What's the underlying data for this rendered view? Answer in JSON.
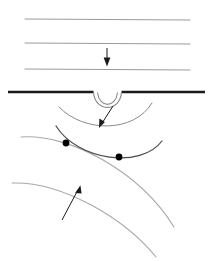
{
  "figure": {
    "width": 213,
    "height": 261,
    "background_color": "#ffffff"
  },
  "colors": {
    "thin_line": "#9a9a9a",
    "interface_line": "#1a1a1a",
    "gray_curve": "#a8a8a8",
    "dark_curve": "#4a4a4a",
    "arrow": "#1a1a1a",
    "dot_fill": "#000000"
  },
  "chart_data": {
    "type": "line",
    "xlabel": "",
    "ylabel": "",
    "xlim": [
      0,
      213
    ],
    "ylim": [
      0,
      261
    ],
    "grid": false,
    "legend": "none",
    "series": [
      {
        "name": "incident-wavefront-1",
        "kind": "straight-line",
        "stroke": "#9a9a9a",
        "stroke_width": 1.1,
        "points": [
          [
            25,
            19
          ],
          [
            190,
            20
          ]
        ]
      },
      {
        "name": "incident-wavefront-2",
        "kind": "straight-line",
        "stroke": "#9a9a9a",
        "stroke_width": 1.1,
        "points": [
          [
            25,
            43
          ],
          [
            190,
            44
          ]
        ]
      },
      {
        "name": "incident-wavefront-3",
        "kind": "straight-line",
        "stroke": "#9a9a9a",
        "stroke_width": 1.1,
        "points": [
          [
            25,
            69
          ],
          [
            190,
            70
          ]
        ]
      },
      {
        "name": "interface-line-left",
        "kind": "straight-line",
        "stroke": "#1a1a1a",
        "stroke_width": 2.3,
        "points": [
          [
            8,
            92
          ],
          [
            93,
            92
          ]
        ]
      },
      {
        "name": "interface-line-right",
        "kind": "straight-line",
        "stroke": "#1a1a1a",
        "stroke_width": 2.3,
        "points": [
          [
            122,
            92
          ],
          [
            205,
            92
          ]
        ]
      },
      {
        "name": "aperture-notch-outer",
        "kind": "arc-open-up",
        "stroke": "#8a8a8a",
        "stroke_width": 1.1,
        "path": "M 93 92 C 94 112, 121 112, 122 92"
      },
      {
        "name": "aperture-notch-inner",
        "kind": "arc-open-up",
        "stroke": "#8a8a8a",
        "stroke_width": 1.1,
        "path": "M 97 93 C 99 108, 117 108, 119 93"
      },
      {
        "name": "diffracted-arc",
        "kind": "arc-open-up",
        "stroke": "#8a8a8a",
        "stroke_width": 1.0,
        "path": "M 60 108 C 85 132, 135 132, 152 104"
      },
      {
        "name": "refracted-dark-curve",
        "kind": "arc-open-up",
        "stroke": "#4a4a4a",
        "stroke_width": 1.2,
        "path": "M 57 126 C 78 160, 140 168, 161 142"
      },
      {
        "name": "gray-arc-upper",
        "kind": "arc-open-down",
        "stroke": "#a8a8a8",
        "stroke_width": 1.1,
        "path": "M 21 137 C 70 134, 140 172, 174 227"
      },
      {
        "name": "gray-arc-lower",
        "kind": "arc-open-down",
        "stroke": "#a8a8a8",
        "stroke_width": 1.1,
        "path": "M 12 183 C 62 182, 124 218, 156 257"
      }
    ],
    "markers": [
      {
        "name": "intersection-point-left",
        "x": 66,
        "y": 143,
        "radius": 3.4,
        "fill": "#000000"
      },
      {
        "name": "intersection-point-right",
        "x": 119,
        "y": 157,
        "radius": 3.4,
        "fill": "#000000"
      }
    ],
    "annotations": [
      {
        "name": "incident-direction-arrow",
        "kind": "arrow",
        "label": "",
        "from": [
          107,
          48
        ],
        "to": [
          107,
          66
        ],
        "direction": "down",
        "stroke": "#1a1a1a",
        "stroke_width": 1.0
      },
      {
        "name": "diffraction-callout-arrow",
        "kind": "arrow",
        "label": "",
        "from": [
          113,
          106
        ],
        "to": [
          99,
          128
        ],
        "direction": "down-left",
        "stroke": "#1a1a1a",
        "stroke_width": 1.0
      },
      {
        "name": "wavefront-callout-arrow",
        "kind": "arrow",
        "label": "",
        "from": [
          62,
          220
        ],
        "to": [
          80,
          186
        ],
        "direction": "up-right",
        "stroke": "#1a1a1a",
        "stroke_width": 1.0
      }
    ]
  }
}
